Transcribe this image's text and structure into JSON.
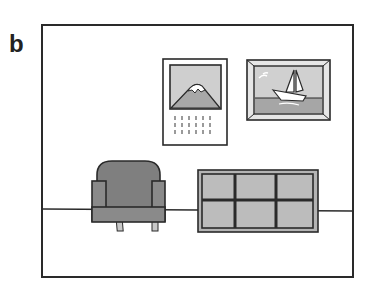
{
  "panel": {
    "label": "b"
  },
  "scene": {
    "description": "Room wall with calendar, framed sailboat picture, armchair and low cabinet",
    "colors": {
      "outline": "#2a2a2a",
      "light_gray": "#c8c8c8",
      "mid_gray": "#a0a0a0",
      "dark_gray": "#7a7a7a",
      "frame_gray": "#b4b4b4",
      "background": "#ffffff"
    },
    "objects": [
      {
        "name": "calendar",
        "picture": "mountain",
        "date_rows": 3,
        "date_cols": 6
      },
      {
        "name": "framed-picture",
        "picture": "sailboat"
      },
      {
        "name": "armchair"
      },
      {
        "name": "cabinet",
        "rows": 2,
        "cols": 3
      },
      {
        "name": "floor-line"
      }
    ]
  }
}
